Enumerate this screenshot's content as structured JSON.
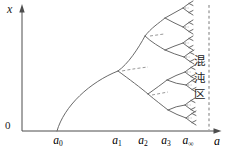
{
  "figure": {
    "colors": {
      "background": "#ffffff",
      "curve": "#6a6a6a",
      "axis": "#4d4d4d",
      "dashed": "#8c8c8c",
      "text": "#222222"
    },
    "y_axis_label": "x",
    "origin_label": "0",
    "x_axis_ticks": [
      {
        "base": "a",
        "sub": "0"
      },
      {
        "base": "a",
        "sub": "1"
      },
      {
        "base": "a",
        "sub": "2"
      },
      {
        "base": "a",
        "sub": "3"
      },
      {
        "base": "a",
        "sub": "∞"
      }
    ],
    "x_axis_symbol": "a",
    "chaos_region_label": "混沌区"
  }
}
